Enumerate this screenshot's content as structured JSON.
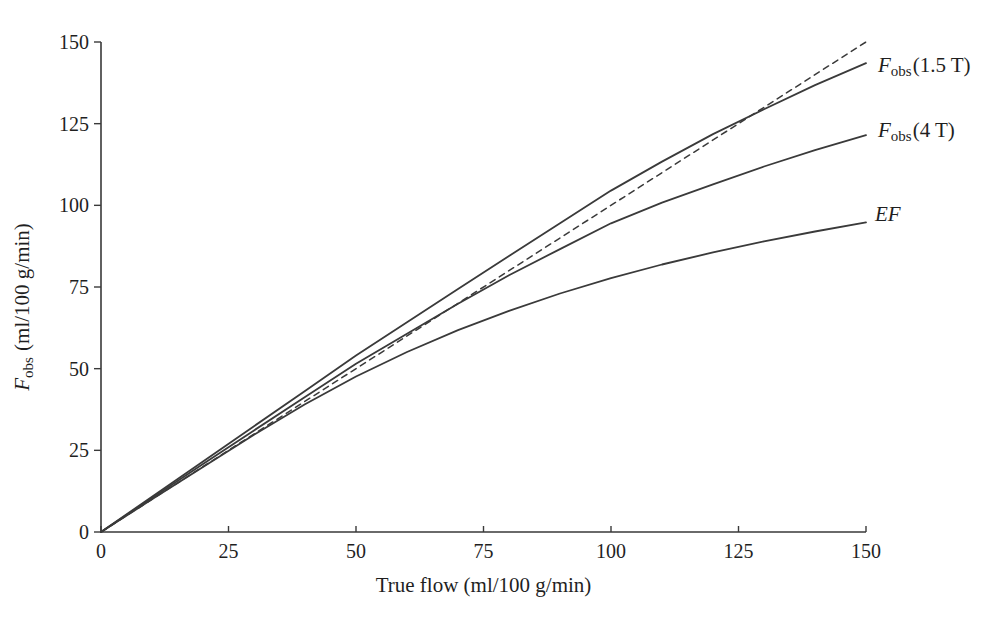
{
  "figure": {
    "background": "#ffffff",
    "line_color": "#3a3a3a",
    "text_color": "#1f1f1f"
  },
  "chart_data": {
    "type": "line",
    "title": "",
    "xlabel": "True flow (ml/100 g/min)",
    "ylabel_parts": {
      "main": "F",
      "sub": "obs",
      "rest": " (ml/100 g/min)"
    },
    "xlim": [
      0,
      150
    ],
    "ylim": [
      0,
      150
    ],
    "xticks": [
      0,
      25,
      50,
      75,
      100,
      125,
      150
    ],
    "yticks": [
      0,
      25,
      50,
      75,
      100,
      125,
      150
    ],
    "grid": false,
    "legend_position": "right-of-curve-ends",
    "series": [
      {
        "name": "identity-line",
        "style": "dashed",
        "description": "identity reference line Fobs = true flow",
        "x": [
          0,
          150
        ],
        "y": [
          0,
          150
        ]
      },
      {
        "name": "fobs-1-5t",
        "style": "solid",
        "label_main": "F",
        "label_sub": "obs",
        "label_rest": "(1.5 T)",
        "x": [
          0,
          10,
          20,
          30,
          40,
          50,
          60,
          70,
          80,
          90,
          100,
          110,
          120,
          130,
          140,
          150
        ],
        "y": [
          0,
          10.8,
          21.6,
          32.4,
          43.2,
          54,
          64.2,
          74.4,
          84.5,
          94.5,
          104.5,
          113.4,
          121.8,
          129.4,
          136.8,
          143.5
        ]
      },
      {
        "name": "fobs-4t",
        "style": "solid",
        "label_main": "F",
        "label_sub": "obs",
        "label_rest": "(4 T)",
        "x": [
          0,
          10,
          20,
          30,
          40,
          50,
          60,
          70,
          80,
          90,
          100,
          110,
          120,
          130,
          140,
          150
        ],
        "y": [
          0,
          10.4,
          20.8,
          31.1,
          41.3,
          51.5,
          60.7,
          69.9,
          78.6,
          86.6,
          94.5,
          100.8,
          106.4,
          111.9,
          116.9,
          121.5
        ]
      },
      {
        "name": "ef",
        "style": "solid",
        "label_main": "EF",
        "x": [
          0,
          10,
          20,
          30,
          40,
          50,
          60,
          70,
          80,
          90,
          100,
          110,
          120,
          130,
          140,
          150
        ],
        "y": [
          0,
          10,
          19.9,
          29.8,
          39.1,
          47.6,
          55.1,
          61.8,
          67.7,
          73,
          77.7,
          81.9,
          85.6,
          89,
          92,
          94.8
        ]
      }
    ]
  }
}
